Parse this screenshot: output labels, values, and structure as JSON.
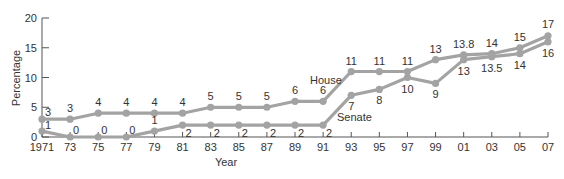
{
  "chart_data": {
    "type": "line",
    "title": "",
    "xlabel": "Year",
    "ylabel": "Percentage",
    "ylim": [
      0,
      20
    ],
    "yticks": [
      "0",
      "5",
      "10",
      "15",
      "20"
    ],
    "grid": false,
    "legend": "inline labels",
    "categories": [
      "1971",
      "73",
      "75",
      "77",
      "79",
      "81",
      "83",
      "85",
      "87",
      "89",
      "91",
      "93",
      "95",
      "97",
      "99",
      "01",
      "03",
      "05",
      "07"
    ],
    "series": [
      {
        "name": "House",
        "values": [
          3,
          3,
          4,
          4,
          4,
          4,
          5,
          5,
          5,
          6,
          6,
          11,
          11,
          11,
          13,
          13.8,
          14,
          15,
          17
        ],
        "labels": [
          "3",
          "3",
          "4",
          "4",
          "4",
          "4",
          "5",
          "5",
          "5",
          "6",
          "6",
          "11",
          "11",
          "11",
          "13",
          "13.8",
          "14",
          "15",
          "17"
        ]
      },
      {
        "name": "Senate",
        "values": [
          1,
          0,
          0,
          0,
          1,
          2,
          2,
          2,
          2,
          2,
          2,
          7,
          8,
          10,
          9,
          13,
          13.5,
          14,
          16
        ],
        "labels": [
          "1",
          "0",
          "0",
          "0",
          "1",
          "2",
          "2",
          "2",
          "2",
          "2",
          "2",
          "7",
          "8",
          "10",
          "9",
          "13",
          "13.5",
          "14",
          "16"
        ]
      }
    ],
    "colors": {
      "line": "#a3a3a3",
      "axis": "#555555",
      "text": "#333333"
    }
  }
}
